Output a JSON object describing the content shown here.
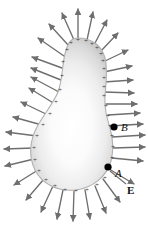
{
  "figure": {
    "type": "physics-diagram",
    "width": 148,
    "height": 230
  },
  "labels": {
    "point_b": "B",
    "point_a": "A",
    "field": "E"
  },
  "colors": {
    "arrow": "#6e6e6e",
    "arrow_dark": "#5a5a5a",
    "surface_edge": "#a8a8a8",
    "surface_fill_outer": "#c9c9c9",
    "surface_fill_inner": "#ffffff",
    "charge_mark": "#3a3a3a",
    "point_dot": "#000000",
    "background": "#ffffff",
    "label": "#101010"
  },
  "shape": {
    "name": "pear-shaped-conductor",
    "description": "Teardrop conductor, narrow rounded top, wide bulbous bottom",
    "outline_path": "M 78 38 C 92 38 102 46 105 58 C 108 70 106 84 105 96 C 104 108 107 118 110 128 C 113 139 114 150 111 161 C 107 176 93 188 76 190 C 58 192 42 184 35 170 C 28 156 30 140 37 127 C 44 114 53 104 58 92 C 63 79 62 62 66 50 C 69 41 72 38 78 38 Z",
    "top_y": 38,
    "bottom_y": 191,
    "widest_left_x": 33,
    "widest_right_x": 113,
    "widest_y": 158
  },
  "points": [
    {
      "name": "point-b",
      "label": "B",
      "cx": 114,
      "cy": 127,
      "r": 3.6,
      "location": "outside-surface-right"
    },
    {
      "name": "point-a",
      "label": "A",
      "cx": 108,
      "cy": 167,
      "r": 3.6,
      "location": "on-surface-lower-right"
    }
  ],
  "charges": {
    "symbol": "+",
    "count": 34,
    "description": "Positive charges distributed along the conductor surface, denser at regions of high curvature"
  },
  "field_arrows": {
    "count": 34,
    "direction": "outward-normal",
    "description": "Electric field vectors pointing radially outward from the charged surface, perpendicular to it"
  },
  "annotations": [
    {
      "name": "field-leader-line",
      "from": "E label",
      "to": "field arrow at point A",
      "visible": true
    }
  ],
  "charge_positions": [
    [
      78,
      40
    ],
    [
      86,
      41
    ],
    [
      92,
      44
    ],
    [
      97,
      48
    ],
    [
      101,
      54
    ],
    [
      103,
      61
    ],
    [
      104,
      69
    ],
    [
      104,
      78
    ],
    [
      104,
      87
    ],
    [
      104,
      96
    ],
    [
      106,
      106
    ],
    [
      108,
      116
    ],
    [
      110,
      126
    ],
    [
      112,
      136
    ],
    [
      113,
      147
    ],
    [
      112,
      158
    ],
    [
      110,
      168
    ],
    [
      105,
      178
    ],
    [
      97,
      185
    ],
    [
      87,
      190
    ],
    [
      76,
      191
    ],
    [
      65,
      190
    ],
    [
      55,
      186
    ],
    [
      46,
      180
    ],
    [
      39,
      171
    ],
    [
      35,
      160
    ],
    [
      34,
      148
    ],
    [
      37,
      136
    ],
    [
      43,
      125
    ],
    [
      50,
      114
    ],
    [
      56,
      102
    ],
    [
      60,
      90
    ],
    [
      62,
      76
    ],
    [
      63,
      62
    ],
    [
      67,
      50
    ],
    [
      71,
      43
    ]
  ],
  "arrow_specs": [
    {
      "x1": 78,
      "y1": 38,
      "x2": 78,
      "y2": 9
    },
    {
      "x1": 87,
      "y1": 40,
      "x2": 93,
      "y2": 12
    },
    {
      "x1": 94,
      "y1": 45,
      "x2": 107,
      "y2": 20
    },
    {
      "x1": 100,
      "y1": 52,
      "x2": 118,
      "y2": 33
    },
    {
      "x1": 103,
      "y1": 62,
      "x2": 128,
      "y2": 50
    },
    {
      "x1": 104,
      "y1": 72,
      "x2": 132,
      "y2": 66
    },
    {
      "x1": 104,
      "y1": 82,
      "x2": 133,
      "y2": 80
    },
    {
      "x1": 104,
      "y1": 92,
      "x2": 134,
      "y2": 93
    },
    {
      "x1": 106,
      "y1": 104,
      "x2": 137,
      "y2": 104
    },
    {
      "x1": 108,
      "y1": 115,
      "x2": 140,
      "y2": 113
    },
    {
      "x1": 110,
      "y1": 126,
      "x2": 143,
      "y2": 124
    },
    {
      "x1": 112,
      "y1": 137,
      "x2": 145,
      "y2": 135
    },
    {
      "x1": 113,
      "y1": 148,
      "x2": 145,
      "y2": 147
    },
    {
      "x1": 112,
      "y1": 158,
      "x2": 143,
      "y2": 161
    },
    {
      "x1": 109,
      "y1": 169,
      "x2": 134,
      "y2": 184
    },
    {
      "x1": 103,
      "y1": 179,
      "x2": 120,
      "y2": 202
    },
    {
      "x1": 95,
      "y1": 186,
      "x2": 106,
      "y2": 213
    },
    {
      "x1": 85,
      "y1": 190,
      "x2": 90,
      "y2": 219
    },
    {
      "x1": 74,
      "y1": 191,
      "x2": 73,
      "y2": 221
    },
    {
      "x1": 63,
      "y1": 190,
      "x2": 57,
      "y2": 219
    },
    {
      "x1": 53,
      "y1": 186,
      "x2": 41,
      "y2": 212
    },
    {
      "x1": 44,
      "y1": 179,
      "x2": 26,
      "y2": 200
    },
    {
      "x1": 38,
      "y1": 170,
      "x2": 14,
      "y2": 185
    },
    {
      "x1": 34,
      "y1": 159,
      "x2": 5,
      "y2": 166
    },
    {
      "x1": 34,
      "y1": 148,
      "x2": 4,
      "y2": 149
    },
    {
      "x1": 37,
      "y1": 136,
      "x2": 6,
      "y2": 132
    },
    {
      "x1": 42,
      "y1": 125,
      "x2": 13,
      "y2": 117
    },
    {
      "x1": 48,
      "y1": 115,
      "x2": 21,
      "y2": 102
    },
    {
      "x1": 55,
      "y1": 104,
      "x2": 29,
      "y2": 88
    },
    {
      "x1": 59,
      "y1": 92,
      "x2": 31,
      "y2": 77
    },
    {
      "x1": 61,
      "y1": 80,
      "x2": 31,
      "y2": 68
    },
    {
      "x1": 62,
      "y1": 68,
      "x2": 32,
      "y2": 57
    },
    {
      "x1": 64,
      "y1": 56,
      "x2": 38,
      "y2": 38
    },
    {
      "x1": 69,
      "y1": 46,
      "x2": 49,
      "y2": 24
    },
    {
      "x1": 74,
      "y1": 40,
      "x2": 62,
      "y2": 13
    }
  ]
}
